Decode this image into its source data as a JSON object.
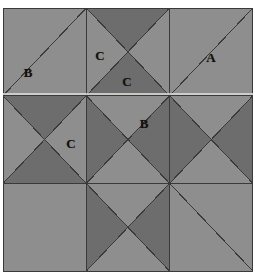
{
  "figure": {
    "type": "geometric-tiling",
    "grid": {
      "columns": 3,
      "rows": 3
    },
    "origin": {
      "x": 3,
      "y": 8
    },
    "tile_size": {
      "width": 83.3,
      "height": 87.7
    },
    "colors": {
      "light": "#8e8e8e",
      "dark": "#6d6d6d",
      "outline": "#3a3a3a",
      "background": "#ffffff",
      "label": "#14100f",
      "highlight_streak": "#d8d8d4"
    },
    "stroke_width": 1.0,
    "tiles": [
      {
        "row": 0,
        "col": 0,
        "top": "light",
        "right": "light",
        "bottom": "light",
        "left": "light",
        "diagonals": "anti"
      },
      {
        "row": 0,
        "col": 1,
        "top": "dark",
        "right": "light",
        "bottom": "dark",
        "left": "light",
        "diagonals": "both"
      },
      {
        "row": 0,
        "col": 2,
        "top": "light",
        "right": "light",
        "bottom": "light",
        "left": "light",
        "diagonals": "anti"
      },
      {
        "row": 1,
        "col": 0,
        "top": "dark",
        "right": "light",
        "bottom": "dark",
        "left": "light",
        "diagonals": "both"
      },
      {
        "row": 1,
        "col": 1,
        "top": "light",
        "right": "dark",
        "bottom": "light",
        "left": "dark",
        "diagonals": "both"
      },
      {
        "row": 1,
        "col": 2,
        "top": "light",
        "right": "dark",
        "bottom": "light",
        "left": "dark",
        "diagonals": "both"
      },
      {
        "row": 2,
        "col": 0,
        "top": "light",
        "right": "light",
        "bottom": "light",
        "left": "light",
        "diagonals": "none"
      },
      {
        "row": 2,
        "col": 1,
        "top": "light",
        "right": "dark",
        "bottom": "light",
        "left": "dark",
        "diagonals": "both"
      },
      {
        "row": 2,
        "col": 2,
        "top": "light",
        "right": "light",
        "bottom": "light",
        "left": "light",
        "diagonals": "main"
      }
    ],
    "labels": [
      {
        "id": "label-b-top-left",
        "text": "B",
        "x": 28,
        "y": 72
      },
      {
        "id": "label-c-top-middle",
        "text": "C",
        "x": 100,
        "y": 55
      },
      {
        "id": "label-c-center-top",
        "text": "C",
        "x": 127,
        "y": 81
      },
      {
        "id": "label-a-top-right",
        "text": "A",
        "x": 211,
        "y": 57
      },
      {
        "id": "label-c-middle-left",
        "text": "C",
        "x": 71,
        "y": 143
      },
      {
        "id": "label-b-center",
        "text": "B",
        "x": 144,
        "y": 123
      }
    ]
  }
}
